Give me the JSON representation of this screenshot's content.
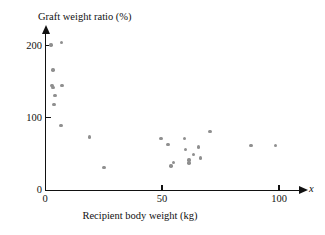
{
  "chart_data": {
    "type": "scatter",
    "title": "",
    "xlabel": "Recipient body weight (kg)",
    "ylabel": "Graft weight ratio (%)",
    "x_variable_symbol": "x",
    "xlim": [
      0,
      110
    ],
    "ylim": [
      0,
      220
    ],
    "xticks": [
      0,
      50,
      100
    ],
    "xtick_labels": [
      "0",
      "50",
      "100"
    ],
    "yticks": [
      0,
      100,
      200
    ],
    "ytick_labels": [
      "0",
      "100",
      "200"
    ],
    "grid": false,
    "legend": null,
    "marker_color": "#8f8f8f",
    "axis_color": "#111111",
    "points": [
      {
        "x": 2.6,
        "y": 201
      },
      {
        "x": 7.0,
        "y": 204
      },
      {
        "x": 3.4,
        "y": 166
      },
      {
        "x": 3.0,
        "y": 145
      },
      {
        "x": 3.4,
        "y": 142
      },
      {
        "x": 7.3,
        "y": 145
      },
      {
        "x": 4.3,
        "y": 131
      },
      {
        "x": 3.9,
        "y": 118
      },
      {
        "x": 6.8,
        "y": 89
      },
      {
        "x": 19.0,
        "y": 73
      },
      {
        "x": 25.2,
        "y": 31
      },
      {
        "x": 49.5,
        "y": 71
      },
      {
        "x": 52.5,
        "y": 63
      },
      {
        "x": 53.8,
        "y": 33
      },
      {
        "x": 55.0,
        "y": 38
      },
      {
        "x": 59.5,
        "y": 71
      },
      {
        "x": 60.0,
        "y": 56
      },
      {
        "x": 61.5,
        "y": 37
      },
      {
        "x": 61.5,
        "y": 41
      },
      {
        "x": 63.5,
        "y": 49
      },
      {
        "x": 65.5,
        "y": 59
      },
      {
        "x": 66.5,
        "y": 44
      },
      {
        "x": 70.5,
        "y": 81
      },
      {
        "x": 88.0,
        "y": 61
      },
      {
        "x": 98.5,
        "y": 61
      }
    ]
  },
  "axes": {
    "x_origin_px": 45,
    "y_origin_px": 189.6,
    "px_per_x_unit": 2.34,
    "px_per_y_unit": 0.72
  }
}
